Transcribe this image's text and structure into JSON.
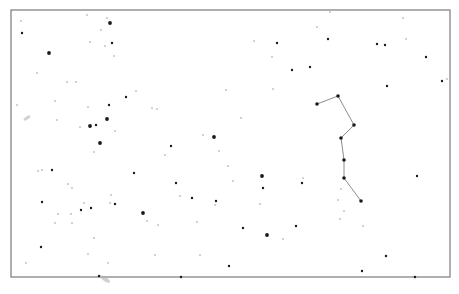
{
  "chart_data": {
    "type": "scatter",
    "title": "",
    "frame": {
      "x": 11,
      "y": 10,
      "width": 439,
      "height": 267,
      "stroke": "#7a7a7a"
    },
    "colors": {
      "background": "#ffffff",
      "star": "#1a1a1a",
      "faint_star": "#9a9a9a",
      "line": "#8c8c8c",
      "galaxy": "#b0b0b0"
    },
    "constellation": {
      "points": [
        [
          317,
          104
        ],
        [
          338,
          96
        ],
        [
          354,
          125
        ],
        [
          341,
          138
        ],
        [
          344,
          160
        ],
        [
          344,
          178
        ],
        [
          361,
          201
        ]
      ]
    },
    "stars": [
      [
        21,
        21,
        1
      ],
      [
        22,
        33,
        2
      ],
      [
        49,
        53,
        3
      ],
      [
        87,
        15,
        1
      ],
      [
        107,
        18,
        1
      ],
      [
        110,
        23,
        3
      ],
      [
        101,
        30,
        1
      ],
      [
        112,
        43,
        2
      ],
      [
        105,
        46,
        1
      ],
      [
        90,
        42,
        1
      ],
      [
        114,
        56,
        1
      ],
      [
        37,
        73,
        1
      ],
      [
        67,
        82,
        1
      ],
      [
        76,
        82,
        1
      ],
      [
        17,
        105,
        1
      ],
      [
        55,
        101,
        1
      ],
      [
        57,
        120,
        1
      ],
      [
        88,
        107,
        1
      ],
      [
        109,
        105,
        2
      ],
      [
        107,
        119,
        3
      ],
      [
        96,
        125,
        2
      ],
      [
        90,
        126,
        3
      ],
      [
        80,
        127,
        1
      ],
      [
        115,
        131,
        1
      ],
      [
        100,
        143,
        3
      ],
      [
        94,
        152,
        1
      ],
      [
        126,
        97,
        2
      ],
      [
        136,
        91,
        1
      ],
      [
        152,
        108,
        1
      ],
      [
        157,
        109,
        1
      ],
      [
        226,
        90,
        1
      ],
      [
        241,
        118,
        1
      ],
      [
        203,
        135,
        1
      ],
      [
        214,
        137,
        3
      ],
      [
        171,
        146,
        2
      ],
      [
        165,
        155,
        1
      ],
      [
        219,
        151,
        1
      ],
      [
        134,
        173,
        2
      ],
      [
        228,
        166,
        1
      ],
      [
        262,
        176,
        3
      ],
      [
        263,
        188,
        2
      ],
      [
        192,
        198,
        2
      ],
      [
        147,
        221,
        1
      ],
      [
        176,
        183,
        2
      ],
      [
        216,
        201,
        2
      ],
      [
        233,
        181,
        1
      ],
      [
        215,
        205,
        1
      ],
      [
        260,
        204,
        1
      ],
      [
        180,
        196,
        1
      ],
      [
        143,
        213,
        3
      ],
      [
        158,
        225,
        1
      ],
      [
        197,
        222,
        1
      ],
      [
        243,
        228,
        2
      ],
      [
        267,
        235,
        3
      ],
      [
        283,
        239,
        1
      ],
      [
        155,
        255,
        1
      ],
      [
        200,
        255,
        1
      ],
      [
        229,
        266,
        2
      ],
      [
        181,
        277,
        2
      ],
      [
        42,
        170,
        1
      ],
      [
        38,
        171,
        1
      ],
      [
        52,
        170,
        2
      ],
      [
        68,
        184,
        1
      ],
      [
        72,
        188,
        1
      ],
      [
        42,
        202,
        2
      ],
      [
        111,
        195,
        1
      ],
      [
        110,
        203,
        1
      ],
      [
        115,
        204,
        2
      ],
      [
        84,
        203,
        1
      ],
      [
        81,
        210,
        2
      ],
      [
        91,
        208,
        2
      ],
      [
        58,
        214,
        1
      ],
      [
        71,
        214,
        1
      ],
      [
        55,
        223,
        1
      ],
      [
        72,
        223,
        1
      ],
      [
        94,
        238,
        1
      ],
      [
        41,
        247,
        2
      ],
      [
        88,
        254,
        1
      ],
      [
        26,
        263,
        1
      ],
      [
        108,
        263,
        1
      ],
      [
        99,
        276,
        2
      ],
      [
        417,
        176,
        2
      ],
      [
        302,
        183,
        2
      ],
      [
        303,
        178,
        1
      ],
      [
        341,
        189,
        1
      ],
      [
        338,
        200,
        1
      ],
      [
        344,
        211,
        1
      ],
      [
        340,
        219,
        1
      ],
      [
        296,
        226,
        2
      ],
      [
        363,
        226,
        1
      ],
      [
        386,
        256,
        2
      ],
      [
        362,
        271,
        2
      ],
      [
        415,
        277,
        2
      ],
      [
        277,
        43,
        2
      ],
      [
        328,
        39,
        2
      ],
      [
        377,
        44,
        2
      ],
      [
        385,
        45,
        2
      ],
      [
        272,
        57,
        1
      ],
      [
        292,
        70,
        2
      ],
      [
        310,
        67,
        2
      ],
      [
        426,
        57,
        2
      ],
      [
        442,
        81,
        2
      ],
      [
        447,
        79,
        1
      ],
      [
        387,
        86,
        2
      ],
      [
        273,
        89,
        1
      ],
      [
        317,
        27,
        1
      ],
      [
        403,
        18,
        1
      ],
      [
        406,
        39,
        1
      ],
      [
        330,
        12,
        1
      ],
      [
        254,
        41,
        1
      ]
    ],
    "galaxies": [
      [
        27,
        118,
        4,
        1.5,
        -35
      ],
      [
        105,
        279,
        6,
        2,
        35
      ]
    ],
    "star_format": "[x, y, magnitude_class 1=faint 2=medium 3=bright]"
  }
}
